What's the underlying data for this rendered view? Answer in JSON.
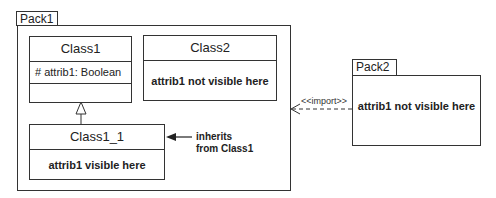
{
  "pack1": {
    "name": "Pack1",
    "class1": {
      "name": "Class1",
      "attribute": "# attrib1: Boolean"
    },
    "class2": {
      "name": "Class2",
      "body": "attrib1 not visible here"
    },
    "class1_1": {
      "name": "Class1_1",
      "body": "attrib1 visible here"
    },
    "inherit_note": {
      "line1": "inherits",
      "line2": "from Class1"
    }
  },
  "pack2": {
    "name": "Pack2",
    "body": "attrib1 not visible here"
  },
  "import_label": "<<import>>"
}
